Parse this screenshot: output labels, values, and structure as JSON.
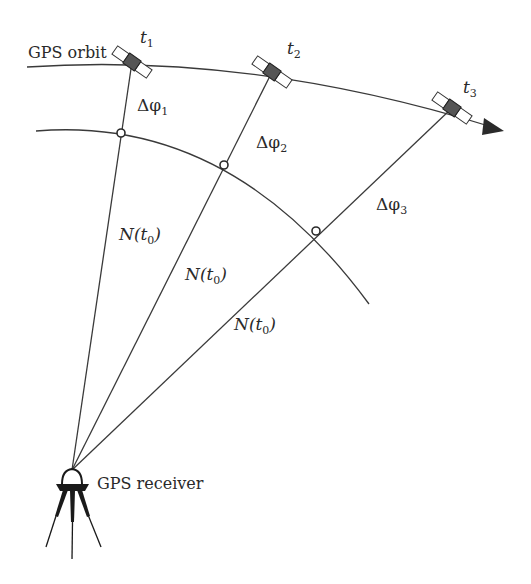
{
  "diagram": {
    "labels": {
      "orbit": "GPS orbit",
      "receiver": "GPS receiver",
      "t1": "t",
      "t1_sub": "1",
      "t2": "t",
      "t2_sub": "2",
      "t3": "t",
      "t3_sub": "3",
      "dphi1": "Δφ",
      "dphi1_sub": "1",
      "dphi2": "Δφ",
      "dphi2_sub": "2",
      "dphi3": "Δφ",
      "dphi3_sub": "3",
      "n1_pre": "N(",
      "n1_t": "t",
      "n1_sub": "0",
      "n1_post": ")",
      "n2_pre": "N(",
      "n2_t": "t",
      "n2_sub": "0",
      "n2_post": ")",
      "n3_pre": "N(",
      "n3_t": "t",
      "n3_sub": "0",
      "n3_post": ")"
    },
    "colors": {
      "line": "#3a3a3a",
      "text": "#2a2a2a",
      "satellite_body": "#555555",
      "panel": "#ffffff",
      "tripod": "#1a1a1a"
    }
  }
}
